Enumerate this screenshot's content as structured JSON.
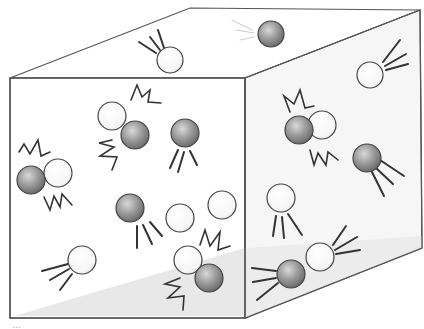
{
  "diagram": {
    "container": {
      "shape": "cube",
      "stroke": "#555555",
      "face_fill": "#ffffff",
      "side_fill": "#f6f6f6",
      "floor_shadow": "#e6e6e6"
    },
    "particle_colors": {
      "light": "#f7f7f7",
      "dark": "#8a8a8a"
    },
    "particles": [
      {
        "id": "p1",
        "type": "light",
        "x": 170,
        "y": 60,
        "r": 13,
        "face": "top",
        "motion": "moving"
      },
      {
        "id": "p2",
        "type": "dark",
        "x": 271,
        "y": 34,
        "r": 13,
        "face": "top",
        "motion": "moving"
      },
      {
        "id": "p3",
        "type": "light",
        "x": 370,
        "y": 75,
        "r": 13,
        "face": "right",
        "motion": "moving"
      },
      {
        "id": "p4",
        "type": "light",
        "x": 112,
        "y": 116,
        "r": 14,
        "face": "front",
        "motion": "colliding"
      },
      {
        "id": "p5",
        "type": "dark",
        "x": 135,
        "y": 135,
        "r": 14,
        "face": "front",
        "motion": "colliding"
      },
      {
        "id": "p6",
        "type": "dark",
        "x": 185,
        "y": 133,
        "r": 14,
        "face": "front",
        "motion": "moving"
      },
      {
        "id": "p7",
        "type": "dark",
        "x": 31,
        "y": 180,
        "r": 14,
        "face": "front",
        "motion": "colliding"
      },
      {
        "id": "p8",
        "type": "light",
        "x": 58,
        "y": 173,
        "r": 14,
        "face": "front",
        "motion": "colliding"
      },
      {
        "id": "p9",
        "type": "dark",
        "x": 130,
        "y": 208,
        "r": 14,
        "face": "front",
        "motion": "moving"
      },
      {
        "id": "p10",
        "type": "light",
        "x": 180,
        "y": 218,
        "r": 14,
        "face": "front",
        "motion": "still"
      },
      {
        "id": "p11",
        "type": "light",
        "x": 222,
        "y": 205,
        "r": 14,
        "face": "front",
        "motion": "still"
      },
      {
        "id": "p12",
        "type": "light",
        "x": 82,
        "y": 260,
        "r": 14,
        "face": "front",
        "motion": "moving"
      },
      {
        "id": "p13",
        "type": "light",
        "x": 188,
        "y": 260,
        "r": 14,
        "face": "front",
        "motion": "colliding"
      },
      {
        "id": "p14",
        "type": "dark",
        "x": 209,
        "y": 278,
        "r": 14,
        "face": "front",
        "motion": "colliding"
      },
      {
        "id": "p15",
        "type": "dark",
        "x": 299,
        "y": 130,
        "r": 14,
        "face": "right",
        "motion": "colliding"
      },
      {
        "id": "p16",
        "type": "light",
        "x": 322,
        "y": 125,
        "r": 14,
        "face": "right",
        "motion": "colliding"
      },
      {
        "id": "p17",
        "type": "dark",
        "x": 367,
        "y": 158,
        "r": 14,
        "face": "right",
        "motion": "moving"
      },
      {
        "id": "p18",
        "type": "light",
        "x": 281,
        "y": 198,
        "r": 14,
        "face": "right",
        "motion": "moving"
      },
      {
        "id": "p19",
        "type": "dark",
        "x": 291,
        "y": 274,
        "r": 14,
        "face": "right",
        "motion": "colliding"
      },
      {
        "id": "p20",
        "type": "light",
        "x": 320,
        "y": 257,
        "r": 14,
        "face": "right",
        "motion": "colliding"
      }
    ],
    "caption_fragment": "…"
  }
}
